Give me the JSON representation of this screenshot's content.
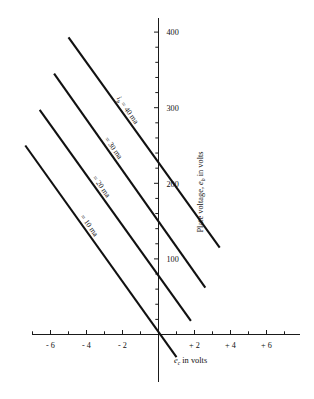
{
  "chart_data": {
    "type": "line",
    "title": "",
    "xlabel": "e_c in volts",
    "ylabel": "Plate voltage, e_b in volts",
    "xlim": [
      -7,
      7
    ],
    "ylim": [
      0,
      400
    ],
    "grid": false,
    "legend_position": "inline-on-curves",
    "x_ticks_major": [
      -6,
      -4,
      -2,
      2,
      4,
      6
    ],
    "x_tick_labels": [
      "- 6",
      "- 4",
      "- 2",
      "+ 2",
      "+ 4",
      "+ 6"
    ],
    "x_tick_step_minor": 1,
    "y_ticks_major": [
      100,
      200,
      300,
      400
    ],
    "y_tick_labels": [
      "100",
      "200",
      "300",
      "400"
    ],
    "y_tick_step_minor": 20,
    "series": [
      {
        "name": "i_b = 40 ma",
        "label": "= 40 ma",
        "label_prefix_symbol": "i",
        "label_prefix_sub": "b",
        "x": [
          -5.0,
          3.4
        ],
        "values": [
          393,
          115
        ]
      },
      {
        "name": "i_b = 30 ma",
        "label": "= 30 ma",
        "x": [
          -5.8,
          2.6
        ],
        "values": [
          345,
          62
        ]
      },
      {
        "name": "i_b = 20 ma",
        "label": "= 20 ma",
        "x": [
          -6.6,
          1.8
        ],
        "values": [
          297,
          18
        ]
      },
      {
        "name": "i_b = 10 ma",
        "label": "= 10 ma",
        "x": [
          -7.4,
          1.0
        ],
        "values": [
          250,
          -30
        ]
      }
    ]
  },
  "axis_titles": {
    "x": {
      "symbol": "e",
      "sub": "c",
      "rest": " in volts"
    },
    "y": {
      "lead": "Plate voltage, ",
      "symbol": "e",
      "sub": "b",
      "rest": " in volts"
    }
  }
}
